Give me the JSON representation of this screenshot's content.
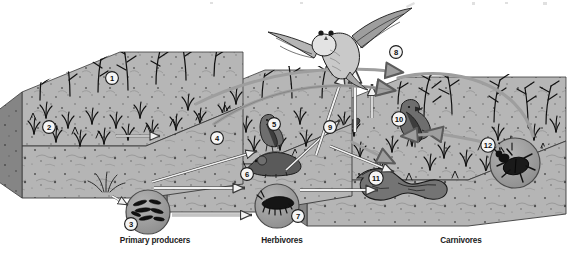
{
  "figure": {
    "kind": "grassland-food-web-diagram",
    "background_color": "#ffffff",
    "ink_color": "#1b1b1b"
  },
  "palette": {
    "soil_side": "#9a9a9a",
    "soil_side_dark": "#7f7f7f",
    "soil_top": "#b9b9b9",
    "soil_cross_section": "#b5b5b5",
    "arrow_fill": "#f2f2f2",
    "arrow_stroke": "#3a3a3a",
    "arc_arrow": "#8c8c8c",
    "circle_inset": "#a5a5a5",
    "circle_stroke": "#4a4a4a",
    "plant_ink": "#111111",
    "caption_color": "#1b1b1b"
  },
  "captions": [
    {
      "id": "primary-producers",
      "label": "Primary producers",
      "x": 155,
      "y": 238
    },
    {
      "id": "herbivores",
      "label": "Herbivores",
      "x": 282,
      "y": 238
    },
    {
      "id": "carnivores",
      "label": "Carnivores",
      "x": 461,
      "y": 238
    }
  ],
  "callouts": [
    {
      "n": "1",
      "x": 112,
      "y": 78,
      "subject": "grass-seed-head"
    },
    {
      "n": "2",
      "x": 49,
      "y": 127,
      "subject": "grass-blades"
    },
    {
      "n": "3",
      "x": 131,
      "y": 224,
      "subject": "soil-bacteria"
    },
    {
      "n": "4",
      "x": 217,
      "y": 138,
      "subject": "grasshopper"
    },
    {
      "n": "5",
      "x": 274,
      "y": 124,
      "subject": "sparrow"
    },
    {
      "n": "6",
      "x": 247,
      "y": 174,
      "subject": "vole"
    },
    {
      "n": "7",
      "x": 298,
      "y": 216,
      "subject": "centipede"
    },
    {
      "n": "8",
      "x": 396,
      "y": 52,
      "subject": "owl"
    },
    {
      "n": "9",
      "x": 330,
      "y": 127,
      "subject": "shrew"
    },
    {
      "n": "10",
      "x": 399,
      "y": 119,
      "subject": "meadowlark"
    },
    {
      "n": "11",
      "x": 376,
      "y": 178,
      "subject": "snake"
    },
    {
      "n": "12",
      "x": 488,
      "y": 145,
      "subject": "ground-beetle"
    }
  ],
  "organisms": [
    {
      "n": "1",
      "name": "Grass seed heads",
      "trophic": "primary producer"
    },
    {
      "n": "2",
      "name": "Grass foliage",
      "trophic": "primary producer"
    },
    {
      "n": "3",
      "name": "Soil bacteria",
      "trophic": "decomposer"
    },
    {
      "n": "4",
      "name": "Grasshopper",
      "trophic": "herbivore"
    },
    {
      "n": "5",
      "name": "Seed-eating bird",
      "trophic": "herbivore"
    },
    {
      "n": "6",
      "name": "Vole",
      "trophic": "herbivore"
    },
    {
      "n": "7",
      "name": "Centipede",
      "trophic": "soil carnivore"
    },
    {
      "n": "8",
      "name": "Owl",
      "trophic": "top carnivore"
    },
    {
      "n": "9",
      "name": "Shrew",
      "trophic": "carnivore"
    },
    {
      "n": "10",
      "name": "Insect-eating bird",
      "trophic": "carnivore"
    },
    {
      "n": "11",
      "name": "Snake",
      "trophic": "carnivore"
    },
    {
      "n": "12",
      "name": "Ground beetle",
      "trophic": "carnivore"
    }
  ],
  "blocks": [
    {
      "id": "primary-producers-block",
      "label": "Primary producers"
    },
    {
      "id": "herbivores-block",
      "label": "Herbivores"
    },
    {
      "id": "carnivores-block",
      "label": "Carnivores"
    }
  ]
}
